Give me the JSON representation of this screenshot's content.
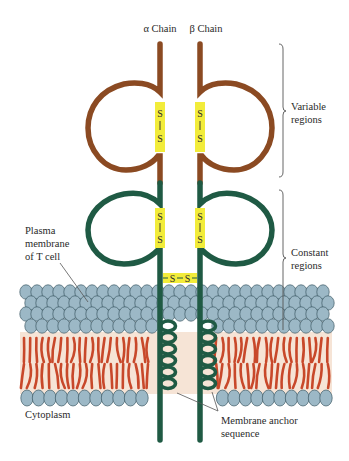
{
  "diagram": {
    "chains": [
      {
        "id": "alpha",
        "label": "α Chain",
        "x": 160
      },
      {
        "id": "beta",
        "label": "β Chain",
        "x": 200
      }
    ],
    "regions": {
      "variable": {
        "line1": "Variable",
        "line2": "regions"
      },
      "constant": {
        "line1": "Constant",
        "line2": "regions"
      }
    },
    "labels": {
      "plasma_membrane": {
        "line1": "Plasma",
        "line2": "membrane",
        "line3": "of T cell"
      },
      "cytoplasm": "Cytoplasm",
      "membrane_anchor": {
        "line1": "Membrane anchor",
        "line2": "sequence"
      }
    },
    "disulfide": {
      "atom": "S",
      "bond": "|",
      "interchain": "S—S"
    },
    "colors": {
      "variable_chain": "#8b4a22",
      "constant_chain": "#1f5a44",
      "disulfide_highlight": "#f2ec3a",
      "lipid_head": "#9cb8c6",
      "lipid_head_outline": "#3d5a66",
      "lipid_tail": "#c8482a",
      "membrane_core": "#f6e4d6"
    }
  }
}
